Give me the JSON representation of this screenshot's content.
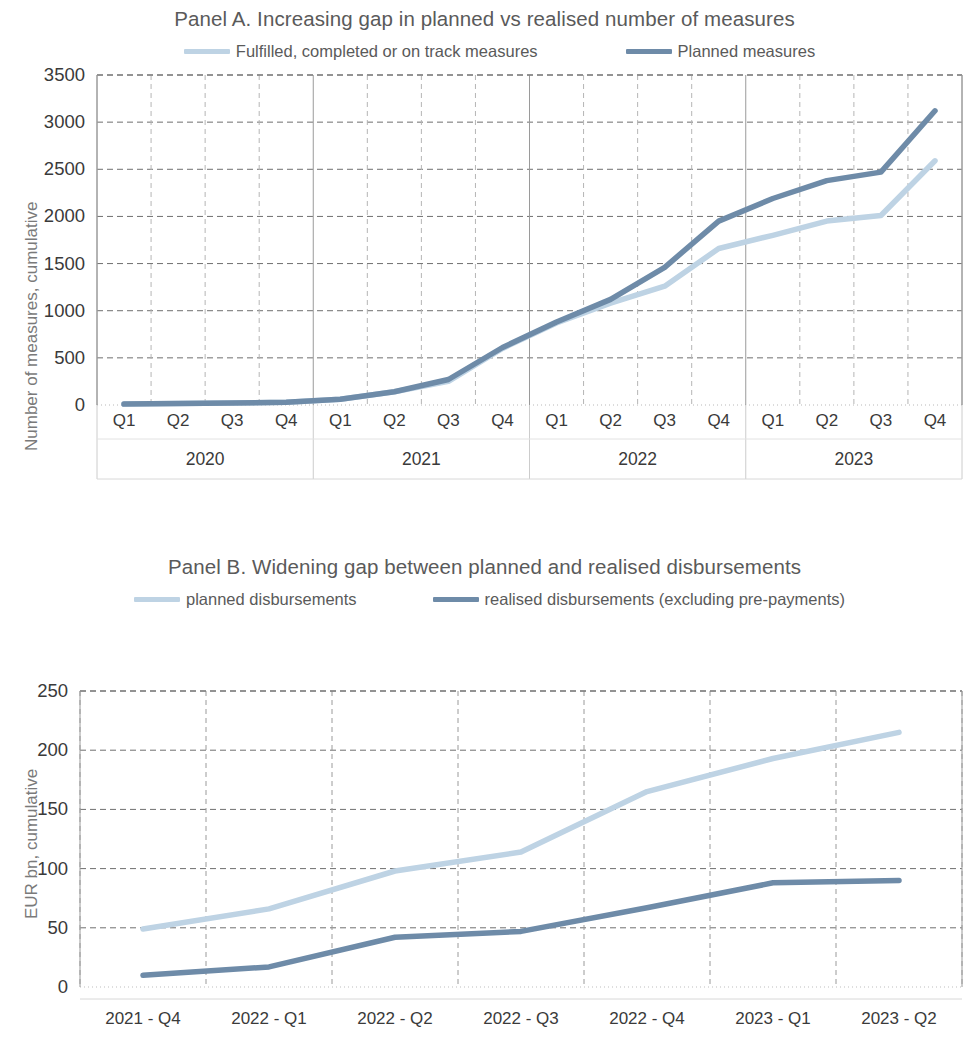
{
  "figure": {
    "background": "#ffffff",
    "colors": {
      "light_series": "#bed3e4",
      "dark_series": "#6e8ba8",
      "grid": "#8c8c8c",
      "text": "#3a3a3a",
      "title_text": "#5a5a5a"
    }
  },
  "panel_a": {
    "title": "Panel A. Increasing gap in planned vs realised number of measures",
    "legend": [
      {
        "label": "Fulfilled, completed or on track measures",
        "color": "#bed3e4"
      },
      {
        "label": "Planned measures",
        "color": "#6e8ba8"
      }
    ],
    "ylabel": "Number of measures, cumulative",
    "yticks": [
      "3500",
      "3000",
      "2500",
      "2000",
      "1500",
      "1000",
      "500",
      "0"
    ],
    "xticks": [
      "Q1",
      "Q2",
      "Q3",
      "Q4",
      "Q1",
      "Q2",
      "Q3",
      "Q4",
      "Q1",
      "Q2",
      "Q3",
      "Q4",
      "Q1",
      "Q2",
      "Q3",
      "Q4"
    ],
    "xgroups": [
      "2020",
      "2021",
      "2022",
      "2023"
    ]
  },
  "panel_b": {
    "title": "Panel B. Widening gap between planned and realised disbursements",
    "legend": [
      {
        "label": "planned disbursements",
        "color": "#bed3e4"
      },
      {
        "label": "realised disbursements (excluding pre-payments)",
        "color": "#6e8ba8"
      }
    ],
    "ylabel": "EUR bn, cumulative",
    "yticks": [
      "250",
      "200",
      "150",
      "100",
      "50",
      "0"
    ],
    "xticks": [
      "2021 - Q4",
      "2022 - Q1",
      "2022 - Q2",
      "2022 - Q3",
      "2022 - Q4",
      "2023 - Q1",
      "2023 - Q2"
    ]
  },
  "chart_data": [
    {
      "type": "line",
      "title": "Panel A. Increasing gap in planned vs realised number of measures",
      "xlabel": "",
      "ylabel": "Number of measures, cumulative",
      "ylim": [
        0,
        3500
      ],
      "ytick_step": 500,
      "grid": true,
      "legend_position": "top",
      "categories": [
        "2020 Q1",
        "2020 Q2",
        "2020 Q3",
        "2020 Q4",
        "2021 Q1",
        "2021 Q2",
        "2021 Q3",
        "2021 Q4",
        "2022 Q1",
        "2022 Q2",
        "2022 Q3",
        "2022 Q4",
        "2023 Q1",
        "2023 Q2",
        "2023 Q3",
        "2023 Q4"
      ],
      "series": [
        {
          "name": "Fulfilled, completed or on track measures",
          "color": "#bed3e4",
          "values": [
            10,
            15,
            20,
            30,
            60,
            140,
            250,
            600,
            870,
            1080,
            1260,
            1660,
            1800,
            1950,
            2010,
            2590
          ]
        },
        {
          "name": "Planned measures",
          "color": "#6e8ba8",
          "values": [
            10,
            15,
            20,
            30,
            60,
            140,
            270,
            610,
            880,
            1120,
            1460,
            1950,
            2190,
            2380,
            2470,
            3120
          ]
        }
      ]
    },
    {
      "type": "line",
      "title": "Panel B. Widening gap between planned and realised disbursements",
      "xlabel": "",
      "ylabel": "EUR bn, cumulative",
      "ylim": [
        0,
        250
      ],
      "ytick_step": 50,
      "grid": true,
      "legend_position": "top",
      "categories": [
        "2021 - Q4",
        "2022 - Q1",
        "2022 - Q2",
        "2022 - Q3",
        "2022 - Q4",
        "2023 - Q1",
        "2023 - Q2"
      ],
      "series": [
        {
          "name": "planned disbursements",
          "color": "#bed3e4",
          "values": [
            49,
            66,
            98,
            114,
            165,
            193,
            215
          ]
        },
        {
          "name": "realised disbursements (excluding pre-payments)",
          "color": "#6e8ba8",
          "values": [
            10,
            17,
            42,
            47,
            67,
            88,
            90
          ]
        }
      ]
    }
  ]
}
